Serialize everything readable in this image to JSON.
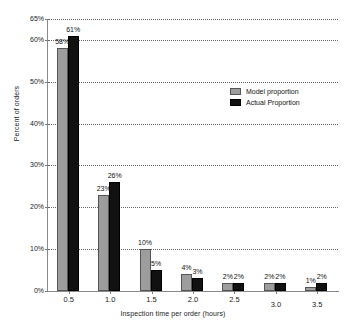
{
  "chart_data": {
    "type": "bar",
    "title": "",
    "xlabel": "Inspection time per order (hours)",
    "ylabel": "Percent of orders",
    "categories": [
      "0.5",
      "1.0",
      "1.5",
      "2.0",
      "2.5",
      "3.0",
      "3.5"
    ],
    "series": [
      {
        "name": "Model proportion",
        "color": "#9d9d9d",
        "values": [
          58,
          23,
          10,
          4,
          2,
          2,
          1
        ]
      },
      {
        "name": "Actual Proportion",
        "color": "#111111",
        "values": [
          61,
          26,
          5,
          3,
          2,
          2,
          2
        ]
      }
    ],
    "value_labels": [
      {
        "model": "58%",
        "actual": "61%"
      },
      {
        "model": "23%",
        "actual": "26%"
      },
      {
        "model": "10%",
        "actual": "5%"
      },
      {
        "model": "4%",
        "actual": "3%"
      },
      {
        "model": "2%",
        "actual": "2%"
      },
      {
        "model": "2%",
        "actual": "2%"
      },
      {
        "model": "1%",
        "actual": "2%"
      }
    ],
    "ylim": [
      0,
      65
    ],
    "yticks": [
      0,
      10,
      20,
      30,
      40,
      50,
      60,
      65
    ],
    "ytick_labels": [
      "0%",
      "10%",
      "20%",
      "30%",
      "40%",
      "50%",
      "60%",
      "65%"
    ],
    "grid": true,
    "grid_style": "dotted-horizontal",
    "legend_position": "upper-right-inside"
  }
}
